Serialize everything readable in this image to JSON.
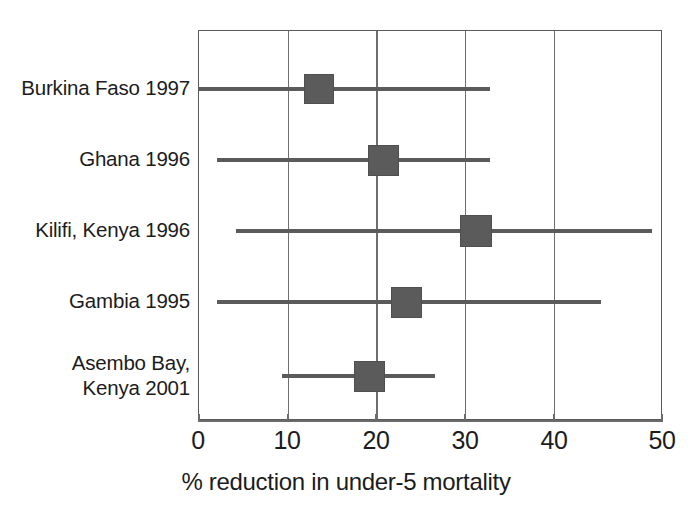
{
  "chart_data": {
    "type": "bar",
    "subtype": "forest-plot",
    "title": "",
    "xlabel": "% reduction in under-5 mortality",
    "ylabel": "",
    "xlim": [
      0,
      50
    ],
    "ylim": [
      0,
      5
    ],
    "xticks": [
      0,
      10,
      20,
      30,
      40,
      50
    ],
    "xticklabels": [
      "0",
      "10",
      "20",
      "30",
      "40",
      "50"
    ],
    "grid": "vertical",
    "legend": "none",
    "categories": [
      "Burkina Faso 1997",
      "Ghana 1996",
      "Kilifi, Kenya 1996",
      "Gambia 1995",
      "Asembo Bay,\nKenya 2001"
    ],
    "values": [
      13,
      20,
      30,
      22.5,
      18.5
    ],
    "ci_low": [
      0,
      2,
      4,
      2,
      9
    ],
    "ci_high": [
      31.5,
      31.5,
      49,
      43.5,
      25.5
    ],
    "marker_color": "#5b5b5b",
    "line_color": "#5b5b5b",
    "grid_color": "#6e6e6e",
    "points": [
      {
        "label": "Burkina Faso 1997",
        "estimate": 13,
        "ci_low": 0,
        "ci_high": 31.5,
        "box_size": 30
      },
      {
        "label": "Ghana 1996",
        "estimate": 20,
        "ci_low": 2,
        "ci_high": 31.5,
        "box_size": 31
      },
      {
        "label": "Kilifi, Kenya 1996",
        "estimate": 30,
        "ci_low": 4,
        "ci_high": 49,
        "box_size": 32
      },
      {
        "label": "Gambia 1995",
        "estimate": 22.5,
        "ci_low": 2,
        "ci_high": 43.5,
        "box_size": 31
      },
      {
        "label": "Asembo Bay, Kenya 2001",
        "estimate": 18.5,
        "ci_low": 9,
        "ci_high": 25.5,
        "box_size": 31
      }
    ]
  },
  "axis": {
    "x_title": "% reduction in under-5 mortality",
    "tick_0": "0",
    "tick_1": "10",
    "tick_2": "20",
    "tick_3": "30",
    "tick_4": "40",
    "tick_5": "50"
  },
  "rows": [
    {
      "label": "Burkina Faso 1997"
    },
    {
      "label": "Ghana 1996"
    },
    {
      "label": "Kilifi, Kenya 1996"
    },
    {
      "label": "Gambia 1995"
    },
    {
      "label": "Asembo Bay,\nKenya 2001"
    }
  ]
}
